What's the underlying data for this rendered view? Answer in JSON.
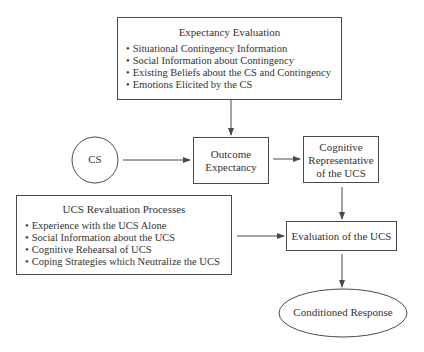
{
  "diagram": {
    "expectancy_evaluation": {
      "title": "Expectancy Evaluation",
      "items": [
        "Situational Contingency Information",
        "Social Information about Contingency",
        "Existing Beliefs about the CS and Contingency",
        "Emotions Elicited by the CS"
      ]
    },
    "cs": {
      "label": "CS"
    },
    "outcome_expectancy": {
      "line1": "Outcome",
      "line2": "Expectancy"
    },
    "cognitive_representative": {
      "line1": "Cognitive",
      "line2": "Representative",
      "line3": "of the UCS"
    },
    "ucs_revaluation": {
      "title": "UCS Revaluation Processes",
      "items": [
        "Experience with the UCS Alone",
        "Social Information about the UCS",
        "Cognitive Rehearsal of UCS",
        "Coping Strategies which Neutralize the UCS"
      ]
    },
    "evaluation_of_ucs": {
      "label": "Evaluation of the UCS"
    },
    "conditioned_response": {
      "label": "Conditioned Response"
    },
    "colors": {
      "line": "#4a4a4a",
      "text": "#333333",
      "background": "#ffffff"
    }
  }
}
